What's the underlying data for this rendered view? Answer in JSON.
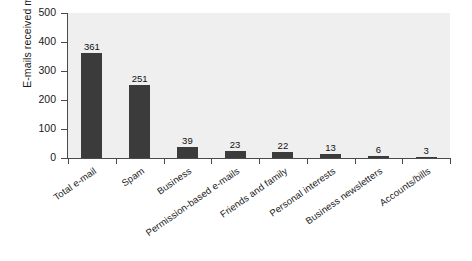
{
  "chart_data": {
    "type": "bar",
    "title": "",
    "subtitle": "",
    "xlabel": "",
    "ylabel": "E-mails received monthly",
    "ylim": [
      0,
      500
    ],
    "yticks": [
      0,
      100,
      200,
      300,
      400,
      500
    ],
    "grid": false,
    "legend": null,
    "orientation": "vertical",
    "bar_color": "#3b3b3b",
    "plot_background": "#efefef",
    "figure_background": "#ffffff",
    "xtick_label_rotation": -35,
    "categories": [
      "Total e-mail",
      "Spam",
      "Business",
      "Permission-based e-mails",
      "Friends and family",
      "Personal interests",
      "Business newsletters",
      "Accounts/bills"
    ],
    "values": [
      361,
      251,
      39,
      23,
      22,
      13,
      6,
      3
    ],
    "value_labels": [
      "361",
      "251",
      "39",
      "23",
      "22",
      "13",
      "6",
      "3"
    ],
    "ytick_labels": [
      "0",
      "100",
      "200",
      "300",
      "400",
      "500"
    ]
  },
  "axis": {
    "y_title": "E-mails received monthly"
  },
  "caption": {
    "clipped_text": ""
  }
}
